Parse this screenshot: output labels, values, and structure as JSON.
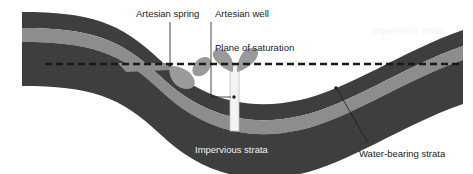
{
  "diagram": {
    "type": "geological-cross-section",
    "colors": {
      "impervious_strata": "#3e3e3e",
      "water_bearing_strata": "#8d8d8d",
      "background": "#ffffff",
      "saturation_line": "#1a1a1a",
      "label_dark": "#1b1b1b",
      "label_light": "#f2f2f2",
      "well_casing": "#f4f4f4",
      "water_spray": "#9a9a9a"
    }
  },
  "labels": {
    "artesian_spring": "Artesian spring",
    "artesian_well": "Artesian well",
    "plane_of_saturation": "Plane of saturation",
    "impervious_strata_top": "Impervious strata",
    "impervious_strata_bottom": "Impervious strata",
    "water_bearing_strata": "Water-bearing strata"
  },
  "label_positions": {
    "artesian_spring": {
      "x": 136,
      "y": 8
    },
    "artesian_well": {
      "x": 215,
      "y": 8
    },
    "plane_of_saturation": {
      "x": 215,
      "y": 42
    },
    "impervious_strata_top": {
      "x": 372,
      "y": 25
    },
    "impervious_strata_bottom": {
      "x": 195,
      "y": 144
    },
    "water_bearing_strata": {
      "x": 359,
      "y": 148
    }
  }
}
